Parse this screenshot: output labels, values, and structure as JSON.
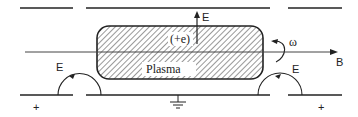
{
  "diagram": {
    "labels": {
      "plasma": "Plasma",
      "charge": "(+e)",
      "field_up": "E",
      "field_left": "E",
      "field_right": "E",
      "magnetic": "B",
      "omega": "ω",
      "plus_left": "+",
      "plus_right": "+"
    },
    "colors": {
      "line": "#222222",
      "background": "#ffffff",
      "label_bg": "#ffffff"
    }
  }
}
